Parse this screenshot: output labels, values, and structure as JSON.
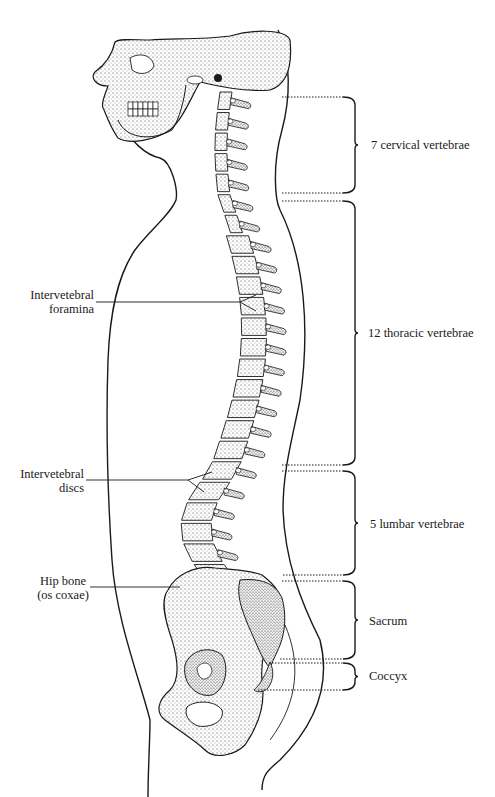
{
  "figure": {
    "left_labels": [
      {
        "id": "foramina",
        "lines": [
          "Intervetebral",
          "foramina"
        ]
      },
      {
        "id": "discs",
        "lines": [
          "Intervetebral",
          "discs"
        ]
      },
      {
        "id": "hip",
        "lines": [
          "Hip bone",
          "(os coxae)"
        ]
      }
    ],
    "regions": [
      {
        "id": "cervical",
        "label": "7 cervical vertebrae",
        "top": 97,
        "bottom": 193
      },
      {
        "id": "thoracic",
        "label": "12 thoracic vertebrae",
        "top": 201,
        "bottom": 465
      },
      {
        "id": "lumbar",
        "label": "5 lumbar vertebrae",
        "top": 471,
        "bottom": 575
      },
      {
        "id": "sacrum",
        "label": "Sacrum",
        "top": 581,
        "bottom": 659
      },
      {
        "id": "coccyx",
        "label": "Coccyx",
        "top": 663,
        "bottom": 690
      }
    ],
    "colors": {
      "ink": "#1a1a1a",
      "stipple": "#3a3a3a",
      "background": "#ffffff"
    }
  }
}
